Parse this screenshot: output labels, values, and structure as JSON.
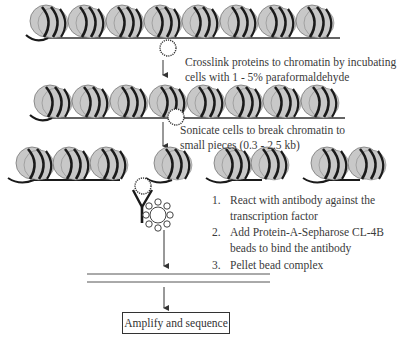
{
  "diagram": {
    "steps": {
      "crosslink": {
        "line1": "Crosslink proteins to chromatin by incubating",
        "line2": "cells with 1 - 5% paraformaldehyde"
      },
      "sonicate": {
        "line1": "Sonicate cells to break chromatin to",
        "line2": "small pieces (0.3 - 2.5 kb)"
      },
      "immunoprecipitation": [
        {
          "num": "1.",
          "line1": "React with antibody against the",
          "line2": "transcription factor"
        },
        {
          "num": "2.",
          "line1": "Add Protein-A-Sepharose CL-4B",
          "line2": "beads to bind the antibody"
        },
        {
          "num": "3.",
          "line1": "Pellet bead complex",
          "line2": ""
        }
      ],
      "final": "Amplify and sequence"
    },
    "elements": {
      "nucleosome_fill": "#c8c8c8",
      "dna_color": "#1a1a1a",
      "row1_nucleosomes": 8,
      "row2_nucleosomes": 8,
      "row3_fragments": [
        3,
        1,
        2,
        2
      ]
    },
    "icons": [
      "nucleosome-icon",
      "transcription-factor-icon",
      "antibody-icon",
      "bead-icon",
      "down-arrow-icon"
    ]
  }
}
